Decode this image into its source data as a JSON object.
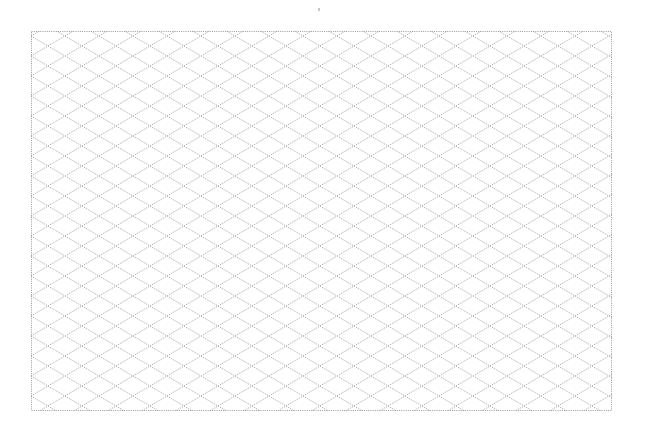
{
  "sheet": {
    "title": "",
    "background": "#ffffff"
  },
  "grid": {
    "type": "isometric",
    "angle_deg": 30,
    "cell_width_px": 34,
    "cell_height_px": 20,
    "line_color": "#9a9a9a",
    "border_color": "#9a9a9a",
    "line_style": "dotted",
    "frame": {
      "left": 31,
      "top": 31,
      "width": 581,
      "height": 380
    }
  }
}
